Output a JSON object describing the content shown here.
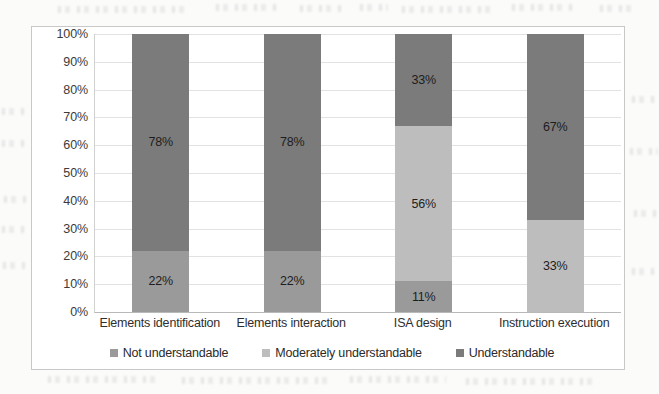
{
  "chart_data": {
    "type": "bar",
    "subtype": "stacked-100-percent",
    "title": "",
    "xlabel": "",
    "ylabel": "",
    "ylim": [
      0,
      100
    ],
    "grid": true,
    "legend_position": "bottom",
    "categories": [
      "Elements identification",
      "Elements interaction",
      "ISA design",
      "Instruction execution"
    ],
    "ytick_labels": [
      "100%",
      "90%",
      "80%",
      "70%",
      "60%",
      "50%",
      "40%",
      "30%",
      "20%",
      "10%",
      "0%"
    ],
    "ytick_values": [
      100,
      90,
      80,
      70,
      60,
      50,
      40,
      30,
      20,
      10,
      0
    ],
    "series": [
      {
        "name": "Not understandable",
        "color": "#9a9a9a",
        "values": [
          22,
          22,
          11,
          0
        ],
        "labels": [
          "22%",
          "22%",
          "11%",
          ""
        ]
      },
      {
        "name": "Moderately understandable",
        "color": "#bdbdbd",
        "values": [
          0,
          0,
          56,
          33
        ],
        "labels": [
          "",
          "",
          "56%",
          "33%"
        ]
      },
      {
        "name": "Understandable",
        "color": "#7b7b7b",
        "values": [
          78,
          78,
          33,
          67
        ],
        "labels": [
          "78%",
          "78%",
          "33%",
          "67%"
        ]
      }
    ],
    "bars": [
      {
        "category": "Elements identification",
        "segments": [
          {
            "series": "Not understandable",
            "value": 22,
            "label": "22%",
            "color": "#9a9a9a"
          },
          {
            "series": "Understandable",
            "value": 78,
            "label": "78%",
            "color": "#7b7b7b"
          }
        ]
      },
      {
        "category": "Elements interaction",
        "segments": [
          {
            "series": "Not understandable",
            "value": 22,
            "label": "22%",
            "color": "#9a9a9a"
          },
          {
            "series": "Understandable",
            "value": 78,
            "label": "78%",
            "color": "#7b7b7b"
          }
        ]
      },
      {
        "category": "ISA design",
        "segments": [
          {
            "series": "Not understandable",
            "value": 11,
            "label": "11%",
            "color": "#9a9a9a"
          },
          {
            "series": "Moderately understandable",
            "value": 56,
            "label": "56%",
            "color": "#bdbdbd"
          },
          {
            "series": "Understandable",
            "value": 33,
            "label": "33%",
            "color": "#7b7b7b"
          }
        ]
      },
      {
        "category": "Instruction execution",
        "segments": [
          {
            "series": "Moderately understandable",
            "value": 33,
            "label": "33%",
            "color": "#bdbdbd"
          },
          {
            "series": "Understandable",
            "value": 67,
            "label": "67%",
            "color": "#7b7b7b"
          }
        ]
      }
    ],
    "legend": [
      {
        "label": "Not understandable",
        "color": "#9a9a9a"
      },
      {
        "label": "Moderately understandable",
        "color": "#bdbdbd"
      },
      {
        "label": "Understandable",
        "color": "#7b7b7b"
      }
    ]
  },
  "colors": {
    "page_background": "#fbfbfa",
    "plot_background": "#ffffff",
    "frame_border": "#c8c8c8",
    "gridline": "#e2e2e2",
    "axis_line": "#b9b9b9",
    "tick_text": "#3b3b3b",
    "not_understandable": "#9a9a9a",
    "moderately_understandable": "#bdbdbd",
    "understandable": "#7b7b7b"
  }
}
